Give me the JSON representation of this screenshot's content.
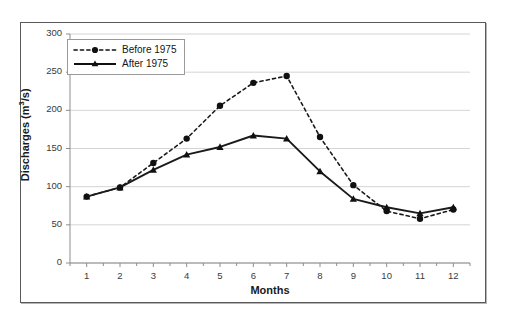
{
  "chart_data": {
    "type": "line",
    "title": "",
    "xlabel": "Months",
    "ylabel": "Discharges (m3/s)",
    "ylabel_display": "Discharges (m",
    "ylabel_sup": "3",
    "ylabel_tail": "/s)",
    "x": [
      1,
      2,
      3,
      4,
      5,
      6,
      7,
      8,
      9,
      10,
      11,
      12
    ],
    "xticklabels": [
      "1",
      "2",
      "3",
      "4",
      "5",
      "6",
      "7",
      "8",
      "9",
      "10",
      "11",
      "12"
    ],
    "yticks": [
      0,
      50,
      100,
      150,
      200,
      250,
      300
    ],
    "yticklabels": [
      "0",
      "50",
      "100",
      "150",
      "200",
      "250",
      "300"
    ],
    "xlim": [
      0.5,
      12.5
    ],
    "ylim": [
      0,
      300
    ],
    "grid": "horizontal",
    "legend_position": "upper-left-inside",
    "series": [
      {
        "name": "Before 1975",
        "marker": "circle",
        "linestyle": "dotted",
        "color": "#101010",
        "values": [
          87,
          99,
          131,
          163,
          206,
          236,
          245,
          165,
          102,
          68,
          58,
          70
        ]
      },
      {
        "name": "After 1975",
        "marker": "triangle",
        "linestyle": "solid",
        "color": "#101010",
        "values": [
          87,
          99,
          122,
          142,
          152,
          167,
          163,
          120,
          84,
          73,
          65,
          73
        ]
      }
    ]
  },
  "legend": {
    "items": [
      {
        "label": "Before 1975",
        "style": "dotted-circle"
      },
      {
        "label": "After 1975",
        "style": "solid-triangle"
      }
    ]
  },
  "colors": {
    "ink": "#101010",
    "grid": "#c9c9c9",
    "axis": "#8d8d8d",
    "frame": "#5a5a5a",
    "background": "#ffffff"
  }
}
